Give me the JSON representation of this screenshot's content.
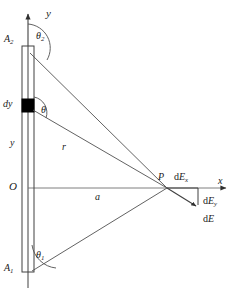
{
  "figure": {
    "type": "physics-vector-diagram",
    "width": 239,
    "height": 291,
    "background_color": "#ffffff",
    "line_color": "#404040",
    "fill_color": "#000000"
  },
  "axes": {
    "y_label": "y",
    "x_label": "x",
    "origin_label": "O"
  },
  "rod": {
    "top_endpoint_label": "A",
    "top_endpoint_sub": "2",
    "bottom_endpoint_label": "A",
    "bottom_endpoint_sub": "1",
    "element_label": "dy",
    "element_position_label": "y"
  },
  "angles": {
    "theta_top_label": "θ",
    "theta_top_sub": "2",
    "theta_element_label": "θ",
    "theta_bottom_label": "θ",
    "theta_bottom_sub": "1"
  },
  "distances": {
    "r_label": "r",
    "a_label": "a"
  },
  "field_point": {
    "point_label": "P",
    "dEx_label": "dE",
    "dEx_sub": "x",
    "dEy_label": "dE",
    "dEy_sub": "y",
    "dE_label": "dE"
  },
  "geometry": {
    "axis_x": 28,
    "origin_y": 188,
    "rod_left": 22,
    "rod_right": 34,
    "rod_top": 46,
    "rod_bottom": 272,
    "element_top": 100,
    "element_bottom": 112,
    "point_p_x": 167,
    "point_p_y": 188
  }
}
